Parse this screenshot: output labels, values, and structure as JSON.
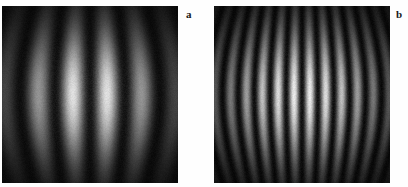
{
  "figure": {
    "background_color": "#fefefe",
    "panel_border_color": "#0a0a0a",
    "label_color": "#1a1a1a",
    "panels": [
      {
        "id": "a",
        "label": "a",
        "x": 2,
        "y": 6,
        "width": 176,
        "height": 177
      },
      {
        "id": "b",
        "label": "b",
        "x": 214,
        "y": 6,
        "width": 176,
        "height": 177
      }
    ]
  },
  "chart_data": [
    {
      "type": "heatmap",
      "id": "panel-a",
      "title": "a",
      "xlabel": "",
      "ylabel": "",
      "colormap": "gray",
      "value_range": [
        0,
        1
      ],
      "description": "Grayscale two-dimensional interference fringe pattern: vertical bright and dark bands, slightly barrel-curved, modulated by an elliptical Gaussian intensity envelope centred in the frame.",
      "grid": false,
      "legend": "none",
      "model": {
        "intensity_formula": "I(x,y) = envelope(x,y) * cos^2(pi * fringes * u(x,y)) , u = (x - 0.5) + curvature * (x - 0.5) * (4*(y-0.5)^2)",
        "fringe_count_across_width": 5,
        "fringe_spacing_px": 35,
        "curvature": 0.22,
        "envelope_sigma_x": 0.3,
        "envelope_sigma_y": 0.26,
        "envelope_center": [
          0.5,
          0.5
        ],
        "peak_gray_level": 252,
        "min_gray_level": 8,
        "background_gray_level": 16,
        "noise_amplitude": 0.055,
        "visibility": 0.92
      },
      "horizontal_profile_row": 0.5,
      "bright_fringe_centers_x_norm": [
        0.06,
        0.28,
        0.5,
        0.72,
        0.94
      ],
      "dark_fringe_centers_x_norm": [
        0.17,
        0.39,
        0.61,
        0.83
      ],
      "horizontal_profile_values": [
        0.05,
        0.22,
        0.46,
        0.62,
        0.55,
        0.32,
        0.11,
        0.03,
        0.12,
        0.38,
        0.7,
        0.9,
        0.95,
        0.82,
        0.52,
        0.2,
        0.04,
        0.02,
        0.18,
        0.52,
        0.84,
        0.99,
        1.0,
        0.92,
        0.66,
        0.3,
        0.07,
        0.02,
        0.14,
        0.42,
        0.72,
        0.89,
        0.91,
        0.76,
        0.47,
        0.18,
        0.04,
        0.03,
        0.1,
        0.3,
        0.5,
        0.59,
        0.52,
        0.35,
        0.16,
        0.05
      ],
      "vertical_profile_col": 0.5,
      "vertical_profile_values": [
        0.02,
        0.04,
        0.07,
        0.12,
        0.19,
        0.28,
        0.4,
        0.53,
        0.67,
        0.79,
        0.89,
        0.96,
        1.0,
        0.99,
        0.94,
        0.86,
        0.74,
        0.61,
        0.47,
        0.34,
        0.23,
        0.15,
        0.09,
        0.05,
        0.03
      ]
    },
    {
      "type": "heatmap",
      "id": "panel-b",
      "title": "b",
      "xlabel": "",
      "ylabel": "",
      "colormap": "gray",
      "value_range": [
        0,
        1
      ],
      "description": "Grayscale two-dimensional interference fringe pattern with roughly twice the spatial frequency of panel a: narrow vertical bright and dark bands, barrel-curved, modulated by an elliptical Gaussian intensity envelope.",
      "grid": false,
      "legend": "none",
      "model": {
        "intensity_formula": "I(x,y) = envelope(x,y) * cos^2(pi * fringes * u(x,y)) , u = (x - 0.5) + curvature * (x - 0.5) * (4*(y-0.5)^2)",
        "fringe_count_across_width": 11,
        "fringe_spacing_px": 16,
        "curvature": 0.2,
        "envelope_sigma_x": 0.34,
        "envelope_sigma_y": 0.27,
        "envelope_center": [
          0.5,
          0.5
        ],
        "peak_gray_level": 250,
        "min_gray_level": 6,
        "background_gray_level": 14,
        "noise_amplitude": 0.065,
        "visibility": 0.94
      },
      "horizontal_profile_row": 0.5,
      "bright_fringe_centers_x_norm": [
        0.045,
        0.135,
        0.227,
        0.318,
        0.409,
        0.5,
        0.591,
        0.682,
        0.773,
        0.864,
        0.955
      ],
      "dark_fringe_centers_x_norm": [
        0.09,
        0.18,
        0.273,
        0.364,
        0.455,
        0.545,
        0.636,
        0.727,
        0.818,
        0.909
      ],
      "horizontal_profile_values": [
        0.1,
        0.32,
        0.14,
        0.02,
        0.24,
        0.55,
        0.26,
        0.03,
        0.36,
        0.72,
        0.4,
        0.05,
        0.5,
        0.86,
        0.54,
        0.07,
        0.62,
        0.95,
        0.64,
        0.08,
        0.68,
        1.0,
        0.7,
        0.08,
        0.66,
        0.96,
        0.62,
        0.07,
        0.58,
        0.88,
        0.52,
        0.05,
        0.44,
        0.74,
        0.38,
        0.04,
        0.3,
        0.57,
        0.24,
        0.03,
        0.18,
        0.36,
        0.14,
        0.02,
        0.09,
        0.18
      ],
      "vertical_profile_col": 0.5,
      "vertical_profile_values": [
        0.02,
        0.03,
        0.06,
        0.11,
        0.18,
        0.27,
        0.39,
        0.52,
        0.66,
        0.78,
        0.88,
        0.96,
        1.0,
        0.98,
        0.93,
        0.85,
        0.73,
        0.6,
        0.46,
        0.33,
        0.22,
        0.14,
        0.08,
        0.04,
        0.02
      ]
    }
  ]
}
